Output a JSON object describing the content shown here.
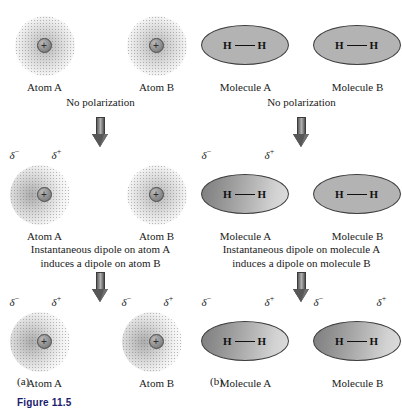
{
  "figure": {
    "caption": "Figure 11.5",
    "panel_a_letter": "(a)",
    "panel_b_letter": "(b)"
  },
  "symbols": {
    "delta_neg": "δ",
    "delta_neg_sign": "−",
    "delta_pos": "δ",
    "delta_pos_sign": "+",
    "nucleus_charge": "+",
    "hydrogen": "H"
  },
  "panel_a": {
    "title_letter": "(a)",
    "rows": [
      {
        "state": "unpolarized",
        "items": [
          {
            "label": "Atom A",
            "polarized": false
          },
          {
            "label": "Atom B",
            "polarized": false
          }
        ],
        "statement": [
          "No polarization"
        ]
      },
      {
        "state": "instantaneous-dipole",
        "items": [
          {
            "label": "Atom A",
            "polarized": true
          },
          {
            "label": "Atom B",
            "polarized": false
          }
        ],
        "statement": [
          "Instantaneous dipole on atom A",
          "induces a dipole on atom B"
        ]
      },
      {
        "state": "induced-dipole",
        "items": [
          {
            "label": "Atom A",
            "polarized": true
          },
          {
            "label": "Atom B",
            "polarized": true
          }
        ],
        "statement": []
      }
    ]
  },
  "panel_b": {
    "title_letter": "(b)",
    "rows": [
      {
        "state": "unpolarized",
        "items": [
          {
            "label": "Molecule A",
            "polarized": false
          },
          {
            "label": "Molecule B",
            "polarized": false
          }
        ],
        "statement": [
          "No polarization"
        ]
      },
      {
        "state": "instantaneous-dipole",
        "items": [
          {
            "label": "Molecule A",
            "polarized": true
          },
          {
            "label": "Molecule B",
            "polarized": false
          }
        ],
        "statement": [
          "Instantaneous dipole on molecule A",
          "induces a dipole on molecule B"
        ]
      },
      {
        "state": "induced-dipole",
        "items": [
          {
            "label": "Molecule A",
            "polarized": true
          },
          {
            "label": "Molecule B",
            "polarized": true
          }
        ],
        "statement": []
      }
    ]
  },
  "colors": {
    "background": "#ffffff",
    "text": "#1a1a1a",
    "particle_fill": "#b3b3b3",
    "particle_outline": "#3d3d3d",
    "arrow": "#6f6f6f",
    "caption": "#1b1b6e"
  }
}
